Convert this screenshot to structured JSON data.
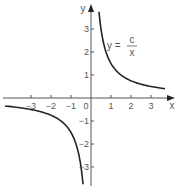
{
  "chart_data": {
    "type": "line",
    "title": "",
    "equation_label": {
      "lhs": "y =",
      "numerator": "c",
      "denominator": "x"
    },
    "xlabel": "x",
    "ylabel": "y",
    "x_ticks": [
      -3,
      -2,
      -1,
      0,
      1,
      2,
      3
    ],
    "x_tick_labels": [
      "−3",
      "−2",
      "−1",
      "0",
      "1",
      "2",
      "3"
    ],
    "y_ticks": [
      -3,
      -2,
      -1,
      1,
      2,
      3
    ],
    "y_tick_labels": [
      "−3",
      "−2",
      "−1",
      "1",
      "2",
      "3"
    ],
    "xlim": [
      -4.5,
      4.0
    ],
    "ylim": [
      -3.8,
      4.0
    ],
    "grid": false,
    "series": [
      {
        "name": "y = c/x (x>0 branch)",
        "c": 1.5,
        "x_range": [
          0.4,
          3.7
        ]
      },
      {
        "name": "y = c/x (x<0 branch)",
        "c": 1.5,
        "x_range": [
          -4.3,
          -0.4
        ]
      }
    ],
    "colors": {
      "curve": "#222222",
      "axes": "#555555",
      "text": "#555555"
    }
  }
}
